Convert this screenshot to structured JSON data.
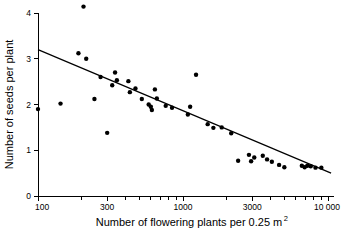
{
  "chart_data": {
    "type": "scatter",
    "title": "",
    "xlabel": "Number of flowering plants per 0.25 m",
    "xlabel_superscript": "2",
    "ylabel": "Number of seeds per plant",
    "xscale": "log",
    "yscale": "linear",
    "xlim": [
      100,
      10000
    ],
    "ylim": [
      0,
      4.3
    ],
    "grid": false,
    "legend": null,
    "x_tick_labels": [
      "100",
      "300",
      "1000",
      "3000",
      "10 000"
    ],
    "x_tick_values": [
      100,
      300,
      1000,
      3000,
      10000
    ],
    "x_minor_ticks": [
      200,
      400,
      500,
      600,
      700,
      800,
      900,
      2000,
      4000,
      5000,
      6000,
      7000,
      8000,
      9000
    ],
    "y_tick_labels": [
      "0",
      "1",
      "2",
      "3",
      "4"
    ],
    "y_tick_values": [
      0,
      1,
      2,
      3,
      4
    ],
    "series": [
      {
        "name": "observations",
        "marker": "filled-circle",
        "color": "#000000",
        "points": [
          [
            100,
            1.9
          ],
          [
            143,
            2.02
          ],
          [
            190,
            3.12
          ],
          [
            206,
            4.14
          ],
          [
            215,
            3.0
          ],
          [
            245,
            2.12
          ],
          [
            270,
            2.6
          ],
          [
            300,
            1.38
          ],
          [
            325,
            2.42
          ],
          [
            340,
            2.7
          ],
          [
            350,
            2.53
          ],
          [
            420,
            2.51
          ],
          [
            430,
            2.27
          ],
          [
            470,
            2.35
          ],
          [
            520,
            2.12
          ],
          [
            580,
            2.0
          ],
          [
            600,
            1.95
          ],
          [
            610,
            1.88
          ],
          [
            640,
            2.33
          ],
          [
            660,
            2.13
          ],
          [
            760,
            1.97
          ],
          [
            840,
            1.93
          ],
          [
            1080,
            1.78
          ],
          [
            1120,
            1.95
          ],
          [
            1230,
            2.65
          ],
          [
            1480,
            1.57
          ],
          [
            1620,
            1.49
          ],
          [
            1850,
            1.5
          ],
          [
            2150,
            1.37
          ],
          [
            2400,
            0.77
          ],
          [
            2850,
            0.9
          ],
          [
            2950,
            0.76
          ],
          [
            3100,
            0.84
          ],
          [
            3550,
            0.88
          ],
          [
            3800,
            0.8
          ],
          [
            4100,
            0.75
          ],
          [
            4600,
            0.68
          ],
          [
            5000,
            0.63
          ],
          [
            6600,
            0.66
          ],
          [
            6900,
            0.63
          ],
          [
            7200,
            0.66
          ],
          [
            7600,
            0.65
          ],
          [
            8200,
            0.62
          ],
          [
            9000,
            0.62
          ]
        ]
      }
    ],
    "fit_line": {
      "name": "regression-line",
      "color": "#000000",
      "x_start": 100,
      "y_start": 3.2,
      "x_end": 10500,
      "y_end": 0.5
    }
  }
}
